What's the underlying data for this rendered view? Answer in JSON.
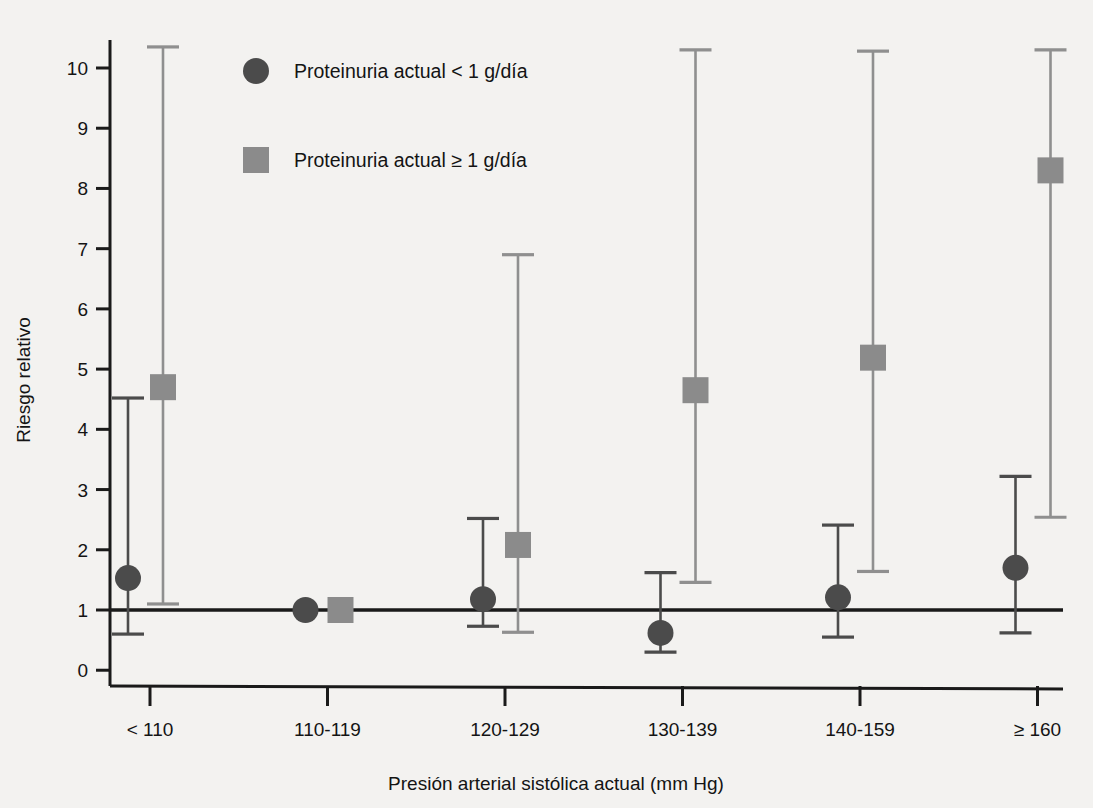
{
  "chart_data": {
    "type": "scatter",
    "title": "",
    "xlabel": "Presión arterial sistólica actual (mm Hg)",
    "ylabel": "Riesgo relativo",
    "categories": [
      "< 110",
      "110-119",
      "120-129",
      "130-139",
      "140-159",
      "≥ 160"
    ],
    "ytick_labels": [
      "0",
      "1",
      "2",
      "3",
      "4",
      "5",
      "6",
      "7",
      "8",
      "9",
      "10"
    ],
    "ytick_values": [
      0,
      1,
      2,
      3,
      4,
      5,
      6,
      7,
      8,
      9,
      10
    ],
    "ylim": [
      0,
      10.6
    ],
    "grid": false,
    "reference_line": 1,
    "legend_position": "top-left",
    "marker_colors": {
      "series_a": "#4b4b4b",
      "series_b": "#8b8b8b"
    },
    "series": [
      {
        "name": "Proteinuria actual < 1 g/día",
        "marker": "circle",
        "color": "#4b4b4b",
        "values": [
          1.53,
          1.0,
          1.18,
          0.62,
          1.21,
          1.7
        ],
        "ci_low": [
          0.6,
          1.0,
          0.73,
          0.3,
          0.55,
          0.62
        ],
        "ci_high": [
          4.52,
          1.0,
          2.52,
          1.62,
          2.41,
          3.22
        ]
      },
      {
        "name": "Proteinuria actual ≥ 1 g/día",
        "marker": "square",
        "color": "#8b8b8b",
        "values": [
          4.7,
          1.0,
          2.08,
          4.65,
          5.19,
          8.3
        ],
        "ci_low": [
          1.1,
          1.0,
          0.63,
          1.46,
          1.64,
          2.54
        ],
        "ci_high": [
          10.35,
          1.0,
          6.9,
          10.3,
          10.28,
          10.3
        ]
      }
    ],
    "legend": [
      {
        "label": "Proteinuria actual < 1 g/día",
        "marker": "circle",
        "color": "#4b4b4b"
      },
      {
        "label": "Proteinuria actual ≥ 1 g/día",
        "marker": "square",
        "color": "#8b8b8b"
      }
    ]
  }
}
